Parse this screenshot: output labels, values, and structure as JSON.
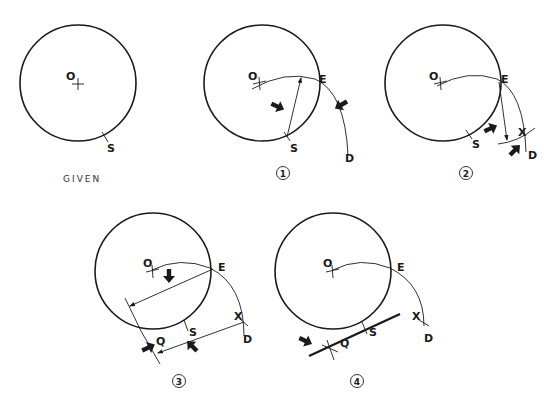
{
  "figure": {
    "panels": [
      {
        "id": "given",
        "caption": "GIVEN",
        "labels": {
          "center": "O",
          "point": "S"
        }
      },
      {
        "id": "step1",
        "caption": "1",
        "labels": {
          "center": "O",
          "intersect": "E",
          "point": "S",
          "arc_end": "D"
        }
      },
      {
        "id": "step2",
        "caption": "2",
        "labels": {
          "center": "O",
          "intersect": "E",
          "point": "S",
          "mark": "X",
          "arc_end": "D"
        }
      },
      {
        "id": "step3",
        "caption": "3",
        "labels": {
          "center": "O",
          "intersect": "E",
          "point": "S",
          "mark": "X",
          "arc_end": "D",
          "tangent_point": "Q"
        }
      },
      {
        "id": "step4",
        "caption": "4",
        "labels": {
          "center": "O",
          "intersect": "E",
          "point": "S",
          "mark": "X",
          "arc_end": "D",
          "tangent_point": "Q"
        }
      }
    ],
    "colors": {
      "ink": "#1a1a1a",
      "background": "#ffffff"
    }
  }
}
